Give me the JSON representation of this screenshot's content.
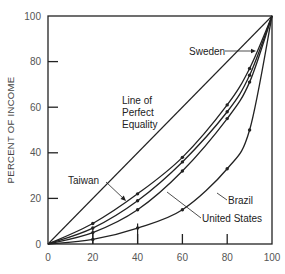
{
  "chart_data": {
    "type": "line",
    "title": "",
    "xlabel": "",
    "ylabel": "PERCENT OF INCOME",
    "xlim": [
      0,
      100
    ],
    "ylim": [
      0,
      100
    ],
    "x_ticks": [
      0,
      20,
      40,
      60,
      80,
      100
    ],
    "y_ticks": [
      0,
      20,
      40,
      60,
      80,
      100
    ],
    "x_tick_labels": [
      "0",
      "20",
      "40",
      "60",
      "80",
      "100"
    ],
    "y_tick_labels": [
      "0",
      "20",
      "40",
      "60",
      "80",
      "100"
    ],
    "grid": false,
    "legend": "none (inline annotations)",
    "x": [
      0,
      20,
      40,
      60,
      80,
      90,
      100
    ],
    "series": [
      {
        "name": "Line of Perfect Equality",
        "values": [
          0,
          20,
          40,
          60,
          80,
          90,
          100
        ]
      },
      {
        "name": "Taiwan",
        "values": [
          0,
          9,
          22,
          38,
          61,
          77,
          100
        ]
      },
      {
        "name": "Sweden",
        "values": [
          0,
          7,
          19,
          36,
          58,
          74,
          100
        ]
      },
      {
        "name": "United States",
        "values": [
          0,
          5,
          15,
          32,
          55,
          71,
          100
        ]
      },
      {
        "name": "Brazil",
        "values": [
          0,
          2,
          7,
          15,
          33,
          50,
          100
        ]
      }
    ],
    "annotations": [
      {
        "text": "Line of Perfect Equality",
        "lines": [
          "Line of",
          "Perfect",
          "Equality"
        ]
      },
      {
        "text": "Sweden"
      },
      {
        "text": "Taiwan"
      },
      {
        "text": "Brazil"
      },
      {
        "text": "United States"
      }
    ]
  },
  "labels": {
    "ylabel": "PERCENT OF INCOME",
    "equality_line1": "Line of",
    "equality_line2": "Perfect",
    "equality_line3": "Equality",
    "sweden": "Sweden",
    "taiwan": "Taiwan",
    "brazil": "Brazil",
    "united_states": "United States"
  }
}
